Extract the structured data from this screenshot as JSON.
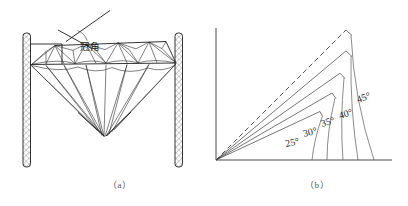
{
  "figure": {
    "background_color": "#ffffff",
    "ink_color": "#1d1d1d",
    "panels": [
      {
        "id": "panel-a",
        "caption": "（a）",
        "subject": "diamond-crown-angle-measurement",
        "annotation_label": "冠角",
        "elements": [
          "left-hatched-post",
          "right-hatched-post",
          "girdle-line",
          "crown-facets",
          "pavilion-facets",
          "crown-angle-indicator"
        ]
      },
      {
        "id": "panel-b",
        "caption": "（b）",
        "subject": "crown-angle-protractor-scale",
        "axis": {
          "vertical_axis": true,
          "horizontal_axis": true,
          "origin_label": ""
        },
        "rays": [
          {
            "label": "25°",
            "angle_deg": 25,
            "style": "solid"
          },
          {
            "label": "30°",
            "angle_deg": 30,
            "style": "solid"
          },
          {
            "label": "35°",
            "angle_deg": 35,
            "style": "solid"
          },
          {
            "label": "40°",
            "angle_deg": 40,
            "style": "solid"
          },
          {
            "label": "45°",
            "angle_deg": 45,
            "style": "dashed"
          }
        ]
      }
    ]
  },
  "labels": {
    "crown_angle_cn": "冠角",
    "a25": "25°",
    "a30": "30°",
    "a35": "35°",
    "a40": "40°",
    "a45": "45°",
    "caption_a": "（a）",
    "caption_b": "（b）"
  }
}
